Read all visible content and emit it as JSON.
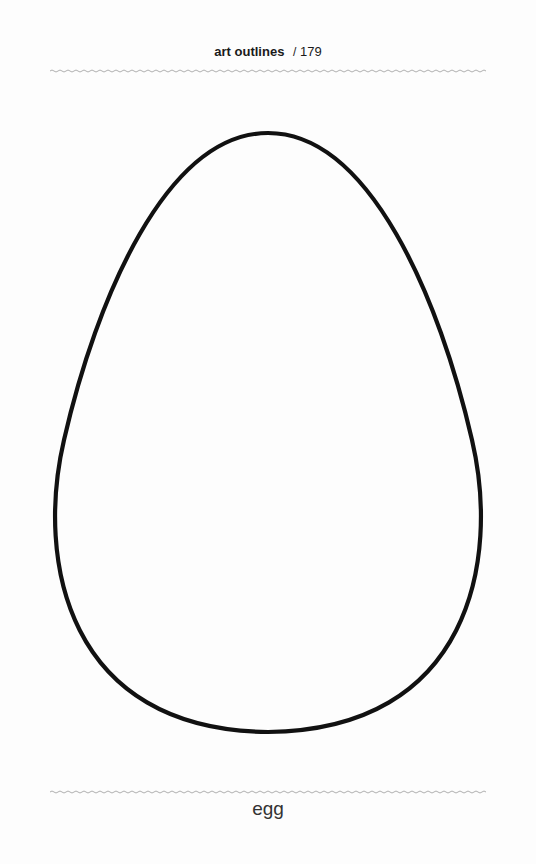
{
  "header": {
    "title": "art outlines",
    "separator": "/",
    "page_number": "179"
  },
  "figure": {
    "shape": "egg-outline",
    "stroke_color": "#111111",
    "stroke_width": 4
  },
  "caption": {
    "label": "egg"
  },
  "colors": {
    "rule": "#9a9a9a",
    "text": "#1a1a1a",
    "background": "#ffffff"
  }
}
